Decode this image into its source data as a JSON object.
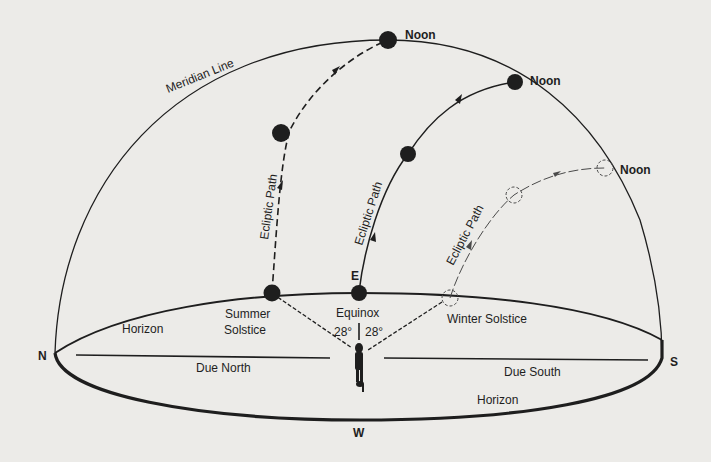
{
  "diagram": {
    "colors": {
      "background": "#ecebe8",
      "ink": "#1e1e1e"
    },
    "labels": {
      "meridian_line": "Meridian Line",
      "noon_summer": "Noon",
      "noon_equinox": "Noon",
      "noon_winter": "Noon",
      "ecliptic_summer": "Ecliptic Path",
      "ecliptic_equinox": "Ecliptic Path",
      "ecliptic_winter": "Ecliptic Path",
      "east": "E",
      "west": "W",
      "north": "N",
      "south": "S",
      "horizon_left": "Horizon",
      "horizon_bottom": "Horizon",
      "summer_solstice_line1": "Summer",
      "summer_solstice_line2": "Solstice",
      "equinox": "Equinox",
      "winter_solstice": "Winter Solstice",
      "angle_left": "28°",
      "angle_right": "28°",
      "due_north": "Due North",
      "due_south": "Due South"
    },
    "paths": [
      {
        "name": "summer-solstice",
        "style": "dashed",
        "sun": "filled"
      },
      {
        "name": "equinox",
        "style": "solid",
        "sun": "filled"
      },
      {
        "name": "winter-solstice",
        "style": "dashed-thin",
        "sun": "dashed-outline"
      }
    ]
  }
}
